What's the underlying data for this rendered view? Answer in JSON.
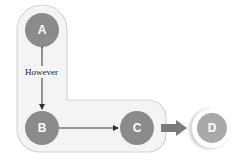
{
  "diagram": {
    "type": "flow",
    "container": {
      "description": "L-shaped rounded group",
      "fill": "#f3f3f3",
      "stroke": "#d9d9d9"
    },
    "nodes": [
      {
        "id": "A",
        "label": "A",
        "color": "#8b8b8b"
      },
      {
        "id": "B",
        "label": "B",
        "color": "#8b8b8b"
      },
      {
        "id": "C",
        "label": "C",
        "color": "#8b8b8b"
      },
      {
        "id": "D",
        "label": "D",
        "color": "#a9a9a9"
      }
    ],
    "edges": [
      {
        "from": "A",
        "to": "B",
        "style": "thin bidirectional arrow",
        "label": "However"
      },
      {
        "from": "B",
        "to": "C",
        "style": "thin arrow",
        "label": ""
      },
      {
        "from": "C",
        "to": "D",
        "style": "thick block arrow",
        "label": "",
        "color": "#7a7a7a"
      }
    ]
  }
}
